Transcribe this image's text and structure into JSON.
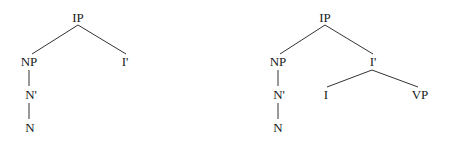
{
  "trees": [
    {
      "name": "left-tree",
      "nodes": {
        "ip": {
          "label": "IP",
          "x": 78,
          "y": 22
        },
        "np": {
          "label": "NP",
          "x": 29,
          "y": 66
        },
        "ibar": {
          "label": "I'",
          "x": 125,
          "y": 66
        },
        "nbar": {
          "label": "N'",
          "x": 30,
          "y": 99
        },
        "n": {
          "label": "N",
          "x": 30,
          "y": 132
        }
      },
      "edges": [
        [
          "ip",
          "np"
        ],
        [
          "ip",
          "ibar"
        ],
        [
          "np",
          "nbar"
        ],
        [
          "nbar",
          "n"
        ]
      ]
    },
    {
      "name": "right-tree",
      "nodes": {
        "ip": {
          "label": "IP",
          "x": 325,
          "y": 22
        },
        "np": {
          "label": "NP",
          "x": 278,
          "y": 66
        },
        "ibar": {
          "label": "I'",
          "x": 372,
          "y": 66
        },
        "nbar": {
          "label": "N'",
          "x": 278,
          "y": 99
        },
        "n": {
          "label": "N",
          "x": 278,
          "y": 132
        },
        "i": {
          "label": "I",
          "x": 326,
          "y": 99
        },
        "vp": {
          "label": "VP",
          "x": 420,
          "y": 99
        }
      },
      "edges": [
        [
          "ip",
          "np"
        ],
        [
          "ip",
          "ibar"
        ],
        [
          "np",
          "nbar"
        ],
        [
          "nbar",
          "n"
        ],
        [
          "ibar",
          "i"
        ],
        [
          "ibar",
          "vp"
        ]
      ]
    }
  ],
  "colors": {
    "text": "#1a1a1a",
    "edge": "#333333",
    "background": "#ffffff"
  }
}
